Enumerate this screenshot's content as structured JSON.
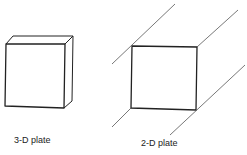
{
  "figure": {
    "type": "diagram",
    "colors": {
      "stroke": "#222222",
      "background": "#ffffff"
    }
  },
  "panels": [
    {
      "id": "three-d",
      "label": "3-D plate",
      "shape": "box"
    },
    {
      "id": "two-d",
      "label": "2-D plate",
      "shape": "square-with-extending-lines"
    }
  ]
}
